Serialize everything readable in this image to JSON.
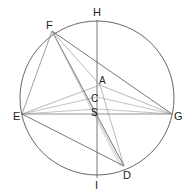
{
  "diagram": {
    "labels": {
      "H": "H",
      "F": "F",
      "A": "A",
      "C": "C",
      "S": "S",
      "E": "E",
      "G": "G",
      "D": "D",
      "I": "I"
    },
    "colors": {
      "stroke": "#555555",
      "light": "#999999",
      "text": "#222222"
    }
  }
}
